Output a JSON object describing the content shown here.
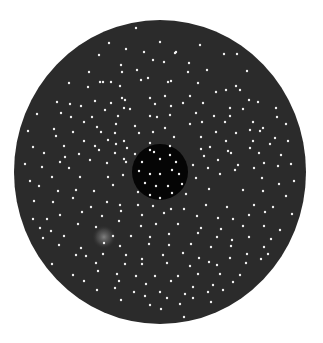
{
  "figure": {
    "background": "#ffffff",
    "outer_disc": {
      "cx": 160,
      "cy": 172,
      "rx": 146,
      "ry": 152,
      "color": "#2b2b2b"
    },
    "inner_disc": {
      "cx": 160,
      "cy": 172,
      "r": 28,
      "color": "#050505"
    },
    "glow": {
      "cx": 104,
      "cy": 237,
      "r": 12,
      "color": "#7a7a7a"
    },
    "dot_color": "#f2f2f2",
    "dot_radius": 1.2,
    "dots": [
      [
        136,
        28
      ],
      [
        109,
        43
      ],
      [
        160,
        42
      ],
      [
        126,
        49
      ],
      [
        176,
        52
      ],
      [
        200,
        45
      ],
      [
        99,
        55
      ],
      [
        144,
        52
      ],
      [
        175,
        53
      ],
      [
        224,
        54
      ],
      [
        237,
        54
      ],
      [
        153,
        60
      ],
      [
        189,
        63
      ],
      [
        164,
        62
      ],
      [
        121,
        65
      ],
      [
        89,
        72
      ],
      [
        122,
        72
      ],
      [
        137,
        70
      ],
      [
        207,
        70
      ],
      [
        247,
        71
      ],
      [
        188,
        72
      ],
      [
        148,
        78
      ],
      [
        100,
        82
      ],
      [
        69,
        83
      ],
      [
        111,
        82
      ],
      [
        141,
        80
      ],
      [
        171,
        81
      ],
      [
        198,
        83
      ],
      [
        236,
        86
      ],
      [
        120,
        86
      ],
      [
        168,
        82
      ],
      [
        226,
        90
      ],
      [
        240,
        90
      ],
      [
        216,
        92
      ],
      [
        88,
        87
      ],
      [
        103,
        82
      ],
      [
        125,
        100
      ],
      [
        122,
        98
      ],
      [
        165,
        96
      ],
      [
        190,
        96
      ],
      [
        57,
        102
      ],
      [
        70,
        104
      ],
      [
        81,
        106
      ],
      [
        95,
        101
      ],
      [
        111,
        103
      ],
      [
        150,
        98
      ],
      [
        155,
        104
      ],
      [
        183,
        103
      ],
      [
        203,
        103
      ],
      [
        249,
        100
      ],
      [
        258,
        102
      ],
      [
        276,
        108
      ],
      [
        230,
        108
      ],
      [
        243,
        109
      ],
      [
        61,
        113
      ],
      [
        92,
        117
      ],
      [
        105,
        110
      ],
      [
        124,
        108
      ],
      [
        130,
        109
      ],
      [
        171,
        106
      ],
      [
        196,
        113
      ],
      [
        230,
        116
      ],
      [
        214,
        116
      ],
      [
        37,
        114
      ],
      [
        71,
        117
      ],
      [
        84,
        122
      ],
      [
        118,
        116
      ],
      [
        150,
        116
      ],
      [
        157,
        117
      ],
      [
        170,
        115
      ],
      [
        202,
        122
      ],
      [
        225,
        122
      ],
      [
        253,
        122
      ],
      [
        277,
        117
      ],
      [
        54,
        129
      ],
      [
        97,
        127
      ],
      [
        116,
        124
      ],
      [
        135,
        126
      ],
      [
        165,
        128
      ],
      [
        190,
        124
      ],
      [
        250,
        130
      ],
      [
        263,
        128
      ],
      [
        286,
        124
      ],
      [
        28,
        131
      ],
      [
        73,
        132
      ],
      [
        101,
        132
      ],
      [
        115,
        133
      ],
      [
        139,
        133
      ],
      [
        153,
        132
      ],
      [
        174,
        137
      ],
      [
        216,
        132
      ],
      [
        236,
        133
      ],
      [
        260,
        131
      ],
      [
        275,
        138
      ],
      [
        56,
        136
      ],
      [
        84,
        141
      ],
      [
        108,
        140
      ],
      [
        124,
        141
      ],
      [
        150,
        143
      ],
      [
        170,
        146
      ],
      [
        201,
        137
      ],
      [
        226,
        141
      ],
      [
        253,
        141
      ],
      [
        33,
        147
      ],
      [
        64,
        146
      ],
      [
        95,
        146
      ],
      [
        116,
        144
      ],
      [
        127,
        148
      ],
      [
        150,
        150
      ],
      [
        201,
        149
      ],
      [
        210,
        147
      ],
      [
        228,
        151
      ],
      [
        250,
        148
      ],
      [
        270,
        144
      ],
      [
        288,
        141
      ],
      [
        44,
        153
      ],
      [
        65,
        157
      ],
      [
        79,
        154
      ],
      [
        99,
        150
      ],
      [
        115,
        153
      ],
      [
        204,
        156
      ],
      [
        231,
        153
      ],
      [
        259,
        153
      ],
      [
        281,
        155
      ],
      [
        25,
        164
      ],
      [
        60,
        162
      ],
      [
        90,
        160
      ],
      [
        124,
        159
      ],
      [
        193,
        165
      ],
      [
        218,
        160
      ],
      [
        238,
        165
      ],
      [
        264,
        163
      ],
      [
        291,
        164
      ],
      [
        42,
        167
      ],
      [
        69,
        168
      ],
      [
        107,
        163
      ],
      [
        126,
        162
      ],
      [
        208,
        168
      ],
      [
        235,
        170
      ],
      [
        254,
        168
      ],
      [
        278,
        166
      ],
      [
        30,
        181
      ],
      [
        52,
        177
      ],
      [
        80,
        177
      ],
      [
        108,
        177
      ],
      [
        123,
        175
      ],
      [
        196,
        178
      ],
      [
        220,
        174
      ],
      [
        262,
        178
      ],
      [
        279,
        184
      ],
      [
        294,
        181
      ],
      [
        39,
        186
      ],
      [
        58,
        191
      ],
      [
        76,
        190
      ],
      [
        94,
        191
      ],
      [
        113,
        185
      ],
      [
        186,
        194
      ],
      [
        209,
        189
      ],
      [
        243,
        190
      ],
      [
        263,
        191
      ],
      [
        286,
        196
      ],
      [
        34,
        201
      ],
      [
        53,
        202
      ],
      [
        73,
        198
      ],
      [
        91,
        207
      ],
      [
        107,
        202
      ],
      [
        120,
        205
      ],
      [
        138,
        205
      ],
      [
        153,
        206
      ],
      [
        171,
        209
      ],
      [
        184,
        209
      ],
      [
        206,
        205
      ],
      [
        227,
        207
      ],
      [
        254,
        205
      ],
      [
        273,
        207
      ],
      [
        33,
        219
      ],
      [
        47,
        219
      ],
      [
        60,
        215
      ],
      [
        82,
        212
      ],
      [
        102,
        216
      ],
      [
        121,
        211
      ],
      [
        142,
        215
      ],
      [
        164,
        213
      ],
      [
        197,
        216
      ],
      [
        218,
        218
      ],
      [
        233,
        219
      ],
      [
        249,
        215
      ],
      [
        265,
        212
      ],
      [
        292,
        214
      ],
      [
        40,
        228
      ],
      [
        51,
        231
      ],
      [
        78,
        224
      ],
      [
        96,
        227
      ],
      [
        119,
        221
      ],
      [
        141,
        226
      ],
      [
        156,
        224
      ],
      [
        178,
        224
      ],
      [
        201,
        228
      ],
      [
        221,
        229
      ],
      [
        243,
        226
      ],
      [
        264,
        226
      ],
      [
        280,
        230
      ],
      [
        43,
        238
      ],
      [
        64,
        236
      ],
      [
        113,
        236
      ],
      [
        131,
        236
      ],
      [
        150,
        237
      ],
      [
        169,
        234
      ],
      [
        198,
        233
      ],
      [
        217,
        237
      ],
      [
        232,
        240
      ],
      [
        249,
        237
      ],
      [
        271,
        239
      ],
      [
        59,
        245
      ],
      [
        81,
        248
      ],
      [
        104,
        243
      ],
      [
        120,
        246
      ],
      [
        149,
        244
      ],
      [
        169,
        245
      ],
      [
        191,
        244
      ],
      [
        211,
        247
      ],
      [
        231,
        246
      ],
      [
        264,
        247
      ],
      [
        76,
        255
      ],
      [
        86,
        256
      ],
      [
        103,
        254
      ],
      [
        126,
        255
      ],
      [
        142,
        259
      ],
      [
        163,
        255
      ],
      [
        183,
        253
      ],
      [
        199,
        258
      ],
      [
        230,
        258
      ],
      [
        247,
        254
      ],
      [
        268,
        254
      ],
      [
        52,
        264
      ],
      [
        96,
        263
      ],
      [
        125,
        264
      ],
      [
        142,
        264
      ],
      [
        167,
        263
      ],
      [
        190,
        266
      ],
      [
        209,
        262
      ],
      [
        217,
        265
      ],
      [
        246,
        263
      ],
      [
        261,
        259
      ],
      [
        73,
        275
      ],
      [
        98,
        271
      ],
      [
        117,
        274
      ],
      [
        136,
        276
      ],
      [
        155,
        276
      ],
      [
        178,
        276
      ],
      [
        198,
        274
      ],
      [
        220,
        274
      ],
      [
        240,
        275
      ],
      [
        84,
        281
      ],
      [
        119,
        281
      ],
      [
        146,
        284
      ],
      [
        171,
        281
      ],
      [
        193,
        287
      ],
      [
        213,
        285
      ],
      [
        233,
        282
      ],
      [
        97,
        290
      ],
      [
        115,
        288
      ],
      [
        134,
        292
      ],
      [
        160,
        292
      ],
      [
        185,
        294
      ],
      [
        208,
        292
      ],
      [
        223,
        290
      ],
      [
        121,
        300
      ],
      [
        145,
        296
      ],
      [
        167,
        298
      ],
      [
        193,
        298
      ],
      [
        211,
        302
      ],
      [
        150,
        305
      ],
      [
        180,
        304
      ],
      [
        161,
        309
      ],
      [
        184,
        317
      ],
      [
        135,
        154
      ],
      [
        154,
        152
      ],
      [
        142,
        162
      ],
      [
        160,
        159
      ],
      [
        170,
        155
      ],
      [
        176,
        162
      ],
      [
        139,
        171
      ],
      [
        150,
        174
      ],
      [
        160,
        174
      ],
      [
        172,
        170
      ],
      [
        179,
        174
      ],
      [
        145,
        183
      ],
      [
        156,
        186
      ],
      [
        168,
        186
      ],
      [
        138,
        192
      ],
      [
        150,
        195
      ],
      [
        160,
        198
      ],
      [
        172,
        193
      ],
      [
        182,
        184
      ]
    ]
  }
}
